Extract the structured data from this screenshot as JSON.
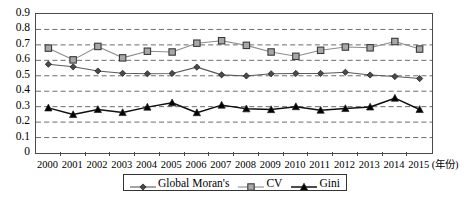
{
  "chart_data": {
    "type": "line",
    "title": "",
    "xlabel": "(年份)",
    "ylabel": "",
    "grid": true,
    "legend_position": "bottom",
    "ylim": [
      0,
      0.9
    ],
    "ytick_labels": [
      "0.9",
      "0.8",
      "0.7",
      "0.6",
      "0.5",
      "0.4",
      "0.3",
      "0.2",
      "0.1",
      "0"
    ],
    "ytick_values": [
      0.9,
      0.8,
      0.7,
      0.6,
      0.5,
      0.4,
      0.3,
      0.2,
      0.1,
      0
    ],
    "categories": [
      "2000",
      "2001",
      "2002",
      "2003",
      "2004",
      "2005",
      "2006",
      "2007",
      "2008",
      "2009",
      "2010",
      "2011",
      "2012",
      "2013",
      "2014",
      "2015"
    ],
    "x": [
      2000,
      2001,
      2002,
      2003,
      2004,
      2005,
      2006,
      2007,
      2008,
      2009,
      2010,
      2011,
      2012,
      2013,
      2014,
      2015
    ],
    "series": [
      {
        "name": "Global Moran's",
        "marker": "diamond",
        "color": "#4f4f4f",
        "values": [
          0.575,
          0.558,
          0.531,
          0.516,
          0.513,
          0.515,
          0.556,
          0.506,
          0.499,
          0.513,
          0.515,
          0.515,
          0.523,
          0.505,
          0.495,
          0.482
        ]
      },
      {
        "name": "CV",
        "marker": "square",
        "color": "#9a9a9a",
        "values": [
          0.679,
          0.603,
          0.69,
          0.616,
          0.659,
          0.654,
          0.711,
          0.727,
          0.697,
          0.654,
          0.626,
          0.665,
          0.686,
          0.681,
          0.722,
          0.673
        ]
      },
      {
        "name": "Gini",
        "marker": "triangle",
        "color": "#111111",
        "values": [
          0.292,
          0.249,
          0.282,
          0.262,
          0.297,
          0.325,
          0.261,
          0.31,
          0.286,
          0.281,
          0.3,
          0.277,
          0.288,
          0.298,
          0.355,
          0.282
        ]
      }
    ]
  },
  "legend": {
    "items": [
      {
        "label": "Global Moran's",
        "marker": "diamond-marker-icon"
      },
      {
        "label": "CV",
        "marker": "square-marker-icon"
      },
      {
        "label": "Gini",
        "marker": "triangle-marker-icon"
      }
    ]
  }
}
